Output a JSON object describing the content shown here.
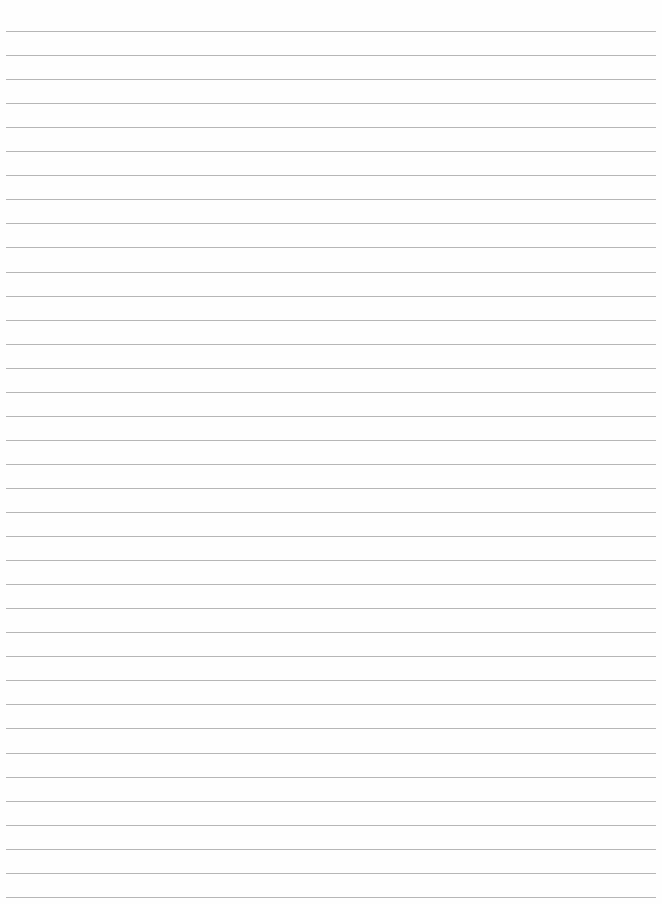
{
  "page": {
    "type": "lined-paper",
    "background_color": "#fefefe",
    "line_color": "#a9a9a9",
    "line_count": 37,
    "first_line_y": 31,
    "line_spacing": 24.05,
    "line_left": 6,
    "line_width": 650
  }
}
